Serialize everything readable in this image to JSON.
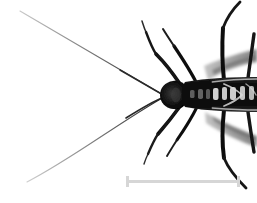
{
  "figure": {
    "title": "Insect specimen macro photograph",
    "background_color": "#ffffff",
    "width_px": 257,
    "height_px": 203,
    "color_mode": "grayscale"
  },
  "specimen": {
    "name": "insect-body",
    "orientation": "dorsal view, head to the left, abdomen to the right",
    "body_color": "#111111",
    "marking_color": "#e8e8e8",
    "wing_color": "#9a9a9a",
    "antenna_color": "#555555",
    "leg_color": "#1a1a1a",
    "parts": {
      "head_label": "head",
      "thorax_label": "thorax",
      "abdomen_label": "abdomen",
      "antenna_upper_label": "left antenna",
      "antenna_lower_label": "right antenna",
      "wing_upper_label": "upper wing",
      "wing_lower_label": "lower wing",
      "legs_label": "legs"
    }
  },
  "scale_bar": {
    "name": "scale-bar",
    "label": "",
    "color": "#d6d6d6",
    "x_start_px": 126,
    "x_end_px": 240,
    "y_px": 181,
    "length_px": 114,
    "cap_height_px": 11,
    "line_thickness_px": 3
  }
}
